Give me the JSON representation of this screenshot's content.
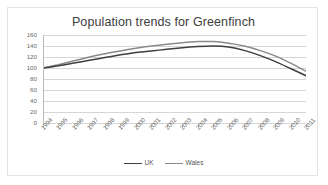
{
  "chart_data": {
    "type": "line",
    "title": "Population trends for Greenfinch",
    "xlabel": "",
    "ylabel": "",
    "ylim": [
      0,
      160
    ],
    "ytick_labels": [
      "160",
      "140",
      "120",
      "100",
      "80",
      "60",
      "40",
      "20",
      "0"
    ],
    "yticks": [
      160,
      140,
      120,
      100,
      80,
      60,
      40,
      20,
      0
    ],
    "grid": true,
    "legend_position": "bottom",
    "categories": [
      "1994",
      "1995",
      "1996",
      "1997",
      "1998",
      "1999",
      "2000",
      "2001",
      "2002",
      "2003",
      "2004",
      "2005",
      "2006",
      "2007",
      "2008",
      "2009",
      "2010",
      "2011"
    ],
    "series": [
      {
        "name": "UK",
        "color": "#3f3f3f",
        "values": [
          100,
          104,
          109,
          114,
          119,
          124,
          128,
          131,
          134,
          137,
          139,
          140,
          138,
          132,
          123,
          112,
          99,
          86
        ]
      },
      {
        "name": "Wales",
        "color": "#8a8a8a",
        "values": [
          100,
          106,
          113,
          120,
          126,
          131,
          136,
          140,
          143,
          146,
          148,
          148,
          145,
          140,
          132,
          122,
          109,
          94
        ]
      }
    ]
  }
}
